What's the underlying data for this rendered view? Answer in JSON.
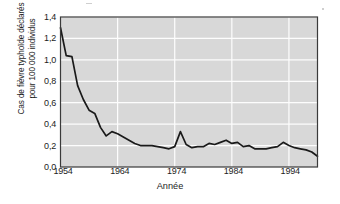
{
  "chart": {
    "ylabel_lines": [
      "Cas de fièvre typhoïde déclarés",
      "pour 100 000 individus"
    ],
    "xlabel": "Année",
    "yticks": [
      "0,0",
      "0,2",
      "0,4",
      "0,6",
      "0,8",
      "1,0",
      "1,2",
      "1,4"
    ],
    "xticks": [
      "1954",
      "1964",
      "1974",
      "1984",
      "1994"
    ],
    "colors": {
      "plot_background": "#d8d8d8",
      "gridline": "#fdfdfd",
      "axis": "#3a3a3a",
      "line": "#1a1a1a",
      "text": "#1d1d1d",
      "page_background": "#ffffff"
    }
  },
  "chart_data": {
    "type": "line",
    "title": "",
    "xlabel": "Année",
    "ylabel": "Cas de fièvre typhoïde déclarés pour 100 000 individus",
    "xlim": [
      1954,
      1999
    ],
    "ylim": [
      0.0,
      1.4
    ],
    "ytick_values": [
      0.0,
      0.2,
      0.4,
      0.6,
      0.8,
      1.0,
      1.2,
      1.4
    ],
    "xtick_values": [
      1954,
      1964,
      1974,
      1984,
      1994
    ],
    "grid": true,
    "legend": null,
    "series": [
      {
        "name": "Cas de fièvre typhoïde déclarés pour 100 000 individus",
        "x": [
          1954,
          1955,
          1956,
          1957,
          1958,
          1959,
          1960,
          1961,
          1962,
          1963,
          1964,
          1965,
          1966,
          1967,
          1968,
          1969,
          1970,
          1971,
          1972,
          1973,
          1974,
          1975,
          1976,
          1977,
          1978,
          1979,
          1980,
          1981,
          1982,
          1983,
          1984,
          1985,
          1986,
          1987,
          1988,
          1989,
          1990,
          1991,
          1992,
          1993,
          1994,
          1995,
          1996,
          1997,
          1998,
          1999
        ],
        "values": [
          1.3,
          1.04,
          1.03,
          0.76,
          0.63,
          0.53,
          0.5,
          0.37,
          0.29,
          0.33,
          0.31,
          0.28,
          0.25,
          0.22,
          0.2,
          0.2,
          0.2,
          0.19,
          0.18,
          0.17,
          0.19,
          0.33,
          0.21,
          0.18,
          0.19,
          0.19,
          0.22,
          0.21,
          0.23,
          0.25,
          0.22,
          0.23,
          0.19,
          0.2,
          0.17,
          0.17,
          0.17,
          0.18,
          0.19,
          0.23,
          0.2,
          0.18,
          0.17,
          0.16,
          0.14,
          0.1
        ]
      }
    ]
  }
}
